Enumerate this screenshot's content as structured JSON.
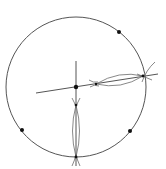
{
  "diagram": {
    "type": "geometric-construction",
    "colors": {
      "line": "#555555",
      "arc": "#6a6a6a",
      "point": "#111111",
      "background": "#ffffff"
    },
    "circle": {
      "cx": 76,
      "cy": 87,
      "r": 70
    },
    "center_point": {
      "x": 76,
      "y": 87
    },
    "circumference_points": [
      {
        "x": 119,
        "y": 32
      },
      {
        "x": 22,
        "y": 130
      },
      {
        "x": 130,
        "y": 131
      },
      {
        "x": 76,
        "y": 157
      },
      {
        "x": 143,
        "y": 76
      }
    ],
    "lines": [
      {
        "x1": 36,
        "y1": 93,
        "x2": 158,
        "y2": 74
      },
      {
        "x1": 76,
        "y1": 61,
        "x2": 76,
        "y2": 166
      }
    ],
    "labels": []
  }
}
